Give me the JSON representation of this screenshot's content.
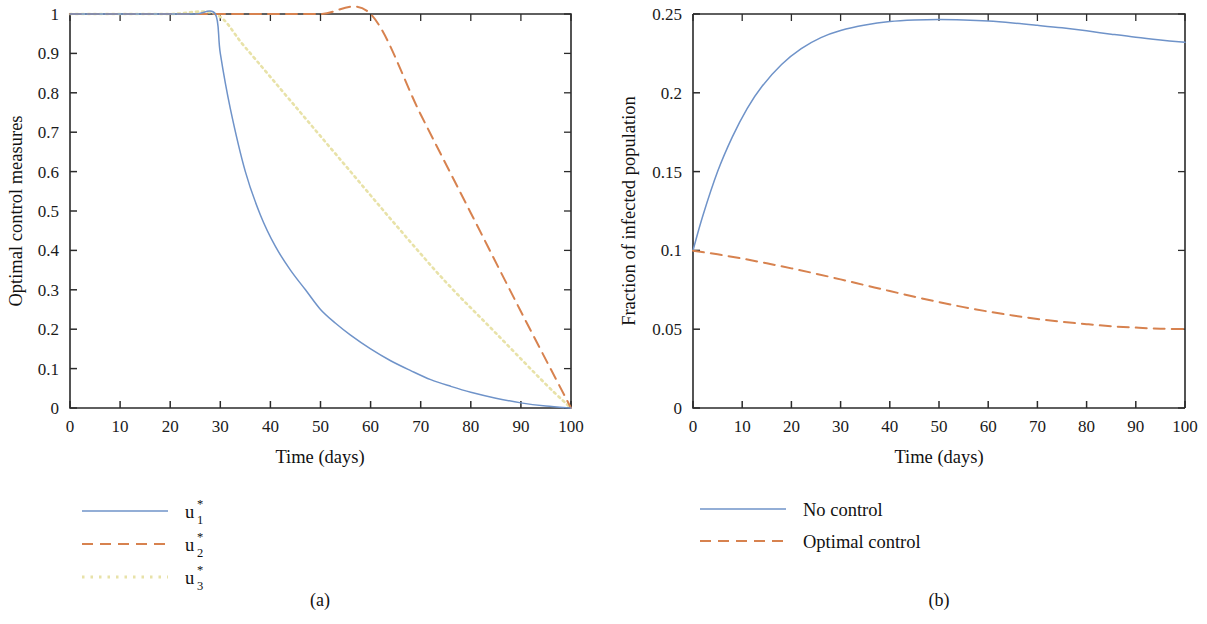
{
  "figure": {
    "panels": [
      {
        "caption": "(a)",
        "xlabel": "Time (days)",
        "ylabel": "Optimal control measures",
        "xticks": [
          "0",
          "10",
          "20",
          "30",
          "40",
          "50",
          "60",
          "70",
          "80",
          "90",
          "100"
        ],
        "yticks": [
          "0",
          "0.1",
          "0.2",
          "0.3",
          "0.4",
          "0.5",
          "0.6",
          "0.7",
          "0.8",
          "0.9",
          "1"
        ],
        "legend": [
          {
            "base": "u",
            "sub": "1",
            "sup": "*",
            "style": "solid",
            "color": "#6f93c9"
          },
          {
            "base": "u",
            "sub": "2",
            "sup": "*",
            "style": "dashed",
            "color": "#d7824f"
          },
          {
            "base": "u",
            "sub": "3",
            "sup": "*",
            "style": "dotted",
            "color": "#e8e2a8"
          }
        ]
      },
      {
        "caption": "(b)",
        "xlabel": "Time (days)",
        "ylabel": "Fraction of infected population",
        "xticks": [
          "0",
          "10",
          "20",
          "30",
          "40",
          "50",
          "60",
          "70",
          "80",
          "90",
          "100"
        ],
        "yticks": [
          "0",
          "0.05",
          "0.1",
          "0.15",
          "0.2",
          "0.25"
        ],
        "legend": [
          {
            "label": "No control",
            "style": "solid",
            "color": "#6f93c9"
          },
          {
            "label": "Optimal control",
            "style": "dashed",
            "color": "#d7824f"
          }
        ]
      }
    ]
  },
  "chart_data": [
    {
      "type": "line",
      "panel": "(a)",
      "title": "",
      "xlabel": "Time (days)",
      "ylabel": "Optimal control measures",
      "xlim": [
        0,
        100
      ],
      "ylim": [
        0,
        1
      ],
      "xtick_values": [
        0,
        10,
        20,
        30,
        40,
        50,
        60,
        70,
        80,
        90,
        100
      ],
      "ytick_values": [
        0,
        0.1,
        0.2,
        0.3,
        0.4,
        0.5,
        0.6,
        0.7,
        0.8,
        0.9,
        1
      ],
      "grid": false,
      "legend_position": "below-left",
      "series": [
        {
          "name": "u1*",
          "style": "solid",
          "color": "#6f93c9",
          "x": [
            0,
            5,
            10,
            15,
            20,
            25,
            29,
            30,
            32,
            35,
            38,
            41,
            44,
            47,
            50,
            53,
            56,
            60,
            64,
            68,
            72,
            76,
            80,
            85,
            90,
            95,
            100
          ],
          "y": [
            1,
            1,
            1,
            1,
            1,
            1,
            1,
            0.9,
            0.76,
            0.6,
            0.49,
            0.41,
            0.35,
            0.3,
            0.25,
            0.215,
            0.185,
            0.15,
            0.12,
            0.095,
            0.072,
            0.055,
            0.04,
            0.025,
            0.013,
            0.005,
            0
          ]
        },
        {
          "name": "u2*",
          "style": "dashed",
          "color": "#d7824f",
          "x": [
            0,
            10,
            20,
            30,
            40,
            50,
            60,
            70,
            80,
            90,
            100
          ],
          "y": [
            1,
            1,
            1,
            1,
            1,
            1,
            1,
            0.745,
            0.495,
            0.245,
            0
          ]
        },
        {
          "name": "u3*",
          "style": "dotted",
          "color": "#e8e2a8",
          "x": [
            0,
            10,
            20,
            29,
            35,
            45,
            55,
            65,
            75,
            85,
            95,
            100
          ],
          "y": [
            1,
            1,
            1,
            1,
            0.915,
            0.765,
            0.615,
            0.465,
            0.32,
            0.19,
            0.06,
            0
          ]
        }
      ]
    },
    {
      "type": "line",
      "panel": "(b)",
      "title": "",
      "xlabel": "Time (days)",
      "ylabel": "Fraction of infected population",
      "xlim": [
        0,
        100
      ],
      "ylim": [
        0,
        0.25
      ],
      "xtick_values": [
        0,
        10,
        20,
        30,
        40,
        50,
        60,
        70,
        80,
        90,
        100
      ],
      "ytick_values": [
        0,
        0.05,
        0.1,
        0.15,
        0.2,
        0.25
      ],
      "grid": false,
      "legend_position": "below-left",
      "series": [
        {
          "name": "No control",
          "style": "solid",
          "color": "#6f93c9",
          "x": [
            0,
            2,
            5,
            8,
            11,
            14,
            18,
            22,
            26,
            30,
            35,
            40,
            45,
            50,
            55,
            60,
            65,
            70,
            75,
            80,
            85,
            90,
            95,
            100
          ],
          "y": [
            0.1,
            0.122,
            0.15,
            0.172,
            0.19,
            0.204,
            0.218,
            0.228,
            0.235,
            0.2395,
            0.243,
            0.2452,
            0.2462,
            0.2465,
            0.2462,
            0.2455,
            0.2443,
            0.2428,
            0.2412,
            0.2393,
            0.2372,
            0.2352,
            0.2335,
            0.232
          ]
        },
        {
          "name": "Optimal control",
          "style": "dashed",
          "color": "#d7824f",
          "x": [
            0,
            5,
            10,
            15,
            20,
            25,
            30,
            35,
            40,
            45,
            50,
            55,
            60,
            65,
            70,
            75,
            80,
            85,
            90,
            95,
            100
          ],
          "y": [
            0.0998,
            0.0975,
            0.0948,
            0.0918,
            0.0886,
            0.0852,
            0.0816,
            0.0779,
            0.0742,
            0.0706,
            0.0672,
            0.064,
            0.0612,
            0.0587,
            0.0565,
            0.0547,
            0.0532,
            0.0519,
            0.051,
            0.0503,
            0.0501
          ]
        }
      ]
    }
  ]
}
